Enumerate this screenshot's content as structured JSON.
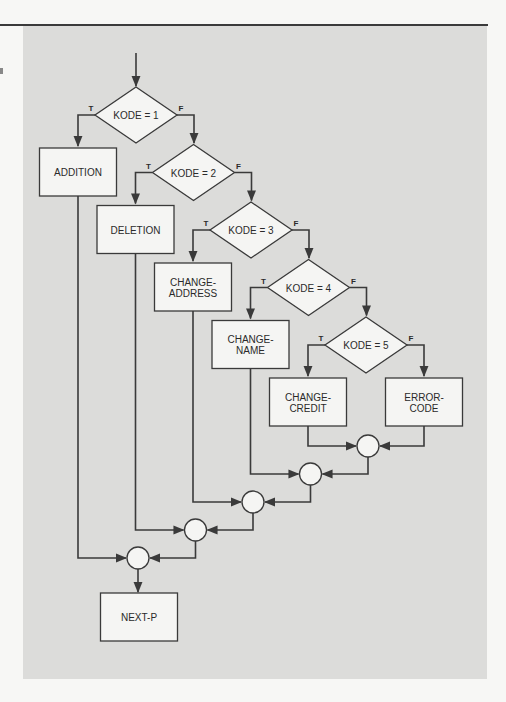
{
  "figure": {
    "type": "flowchart",
    "colors": {
      "panel": "#dcdcda",
      "shape_fill": "#f5f5f3",
      "stroke": "#3a3a3a",
      "page": "#f7f7f5"
    }
  },
  "decisions": [
    {
      "label": "KODE = 1",
      "true_label": "T",
      "false_label": "F"
    },
    {
      "label": "KODE = 2",
      "true_label": "T",
      "false_label": "F"
    },
    {
      "label": "KODE = 3",
      "true_label": "T",
      "false_label": "F"
    },
    {
      "label": "KODE = 4",
      "true_label": "T",
      "false_label": "F"
    },
    {
      "label": "KODE = 5",
      "true_label": "T",
      "false_label": "F"
    }
  ],
  "processes": [
    {
      "lines": [
        "ADDITION"
      ]
    },
    {
      "lines": [
        "DELETION"
      ]
    },
    {
      "lines": [
        "CHANGE-",
        "ADDRESS"
      ]
    },
    {
      "lines": [
        "CHANGE-",
        "NAME"
      ]
    },
    {
      "lines": [
        "CHANGE-",
        "CREDIT"
      ]
    },
    {
      "lines": [
        "ERROR-",
        "CODE"
      ]
    }
  ],
  "terminal": {
    "lines": [
      "NEXT-P"
    ]
  },
  "connectors_count": 5
}
